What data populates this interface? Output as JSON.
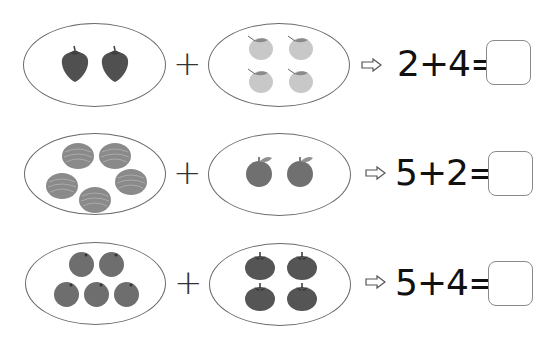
{
  "worksheet": {
    "problems": [
      {
        "left": {
          "fruit": "strawberry",
          "count": 2
        },
        "right": {
          "fruit": "lemon",
          "count": 4
        },
        "operator": "+",
        "arrow_icon": "arrow-right-icon",
        "equation": "2+4=",
        "answer": ""
      },
      {
        "left": {
          "fruit": "melon",
          "count": 5
        },
        "right": {
          "fruit": "apple",
          "count": 2
        },
        "operator": "+",
        "arrow_icon": "arrow-right-icon",
        "equation": "5+2=",
        "answer": ""
      },
      {
        "left": {
          "fruit": "orange",
          "count": 5
        },
        "right": {
          "fruit": "tomato",
          "count": 4
        },
        "operator": "+",
        "arrow_icon": "arrow-right-icon",
        "equation": "5+4=",
        "answer": ""
      }
    ]
  }
}
